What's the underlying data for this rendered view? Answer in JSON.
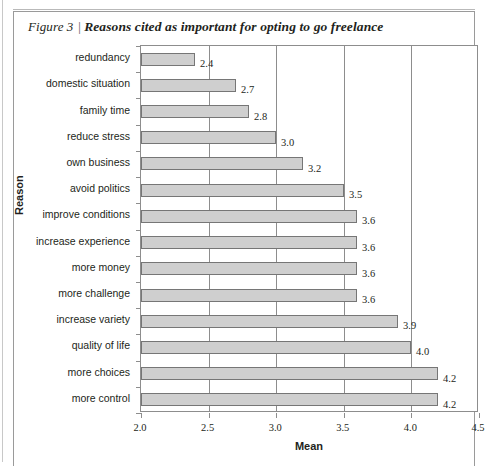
{
  "figure": {
    "number": "Figure 3",
    "separator": "|",
    "title": "Reasons cited as important for opting to go freelance"
  },
  "chart_data": {
    "type": "bar",
    "orientation": "horizontal",
    "title": "Reasons cited as important for opting to go freelance",
    "xlabel": "Mean",
    "ylabel": "Reason",
    "xlim": [
      2.0,
      4.5
    ],
    "xticks": [
      "2.0",
      "2.5",
      "3.0",
      "3.5",
      "4.0",
      "4.5"
    ],
    "xtick_values": [
      2.0,
      2.5,
      3.0,
      3.5,
      4.0,
      4.5
    ],
    "grid": true,
    "legend": null,
    "categories": [
      "redundancy",
      "domestic situation",
      "family time",
      "reduce stress",
      "own business",
      "avoid politics",
      "improve conditions",
      "increase experience",
      "more money",
      "more challenge",
      "increase variety",
      "quality of life",
      "more choices",
      "more control"
    ],
    "values": [
      2.4,
      2.7,
      2.8,
      3.0,
      3.2,
      3.5,
      3.6,
      3.6,
      3.6,
      3.6,
      3.9,
      4.0,
      4.2,
      4.2
    ],
    "value_labels": [
      "2.4",
      "2.7",
      "2.8",
      "3.0",
      "3.2",
      "3.5",
      "3.6",
      "3.6",
      "3.6",
      "3.6",
      "3.9",
      "4.0",
      "4.2",
      "4.2"
    ],
    "bar_color": "#cfcfcf",
    "bar_border_color": "#767676",
    "axis_color": "#8d8d8d"
  }
}
